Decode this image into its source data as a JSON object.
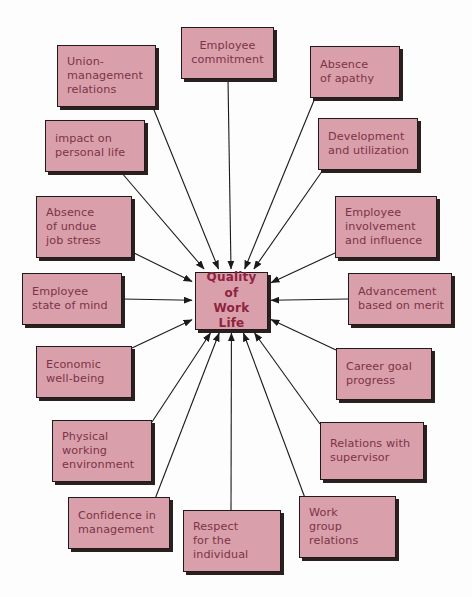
{
  "diagram": {
    "title": "Quality of Work Life",
    "center": {
      "id": "center",
      "label": "Quality of\nWork Life",
      "x": 195,
      "y": 272,
      "w": 73,
      "h": 58
    },
    "colors": {
      "node_fill": "#d9a0ab",
      "node_border": "#201a1a",
      "node_shadow": "#2a2020",
      "node_text": "#7d3347",
      "center_text": "#8e2340",
      "arrow": "#1a1a1a",
      "background": "#fdfdfd"
    },
    "nodes": [
      {
        "id": "union-management-relations",
        "label": "Union-\nmanagement\nrelations",
        "x": 57,
        "y": 45,
        "w": 99,
        "h": 62,
        "align": "left",
        "anchor_x": 152,
        "anchor_y": 105
      },
      {
        "id": "employee-commitment",
        "label": "Employee\ncommitment",
        "x": 181,
        "y": 27,
        "w": 93,
        "h": 52,
        "align": "center",
        "anchor_x": 228,
        "anchor_y": 79
      },
      {
        "id": "absence-of-apathy",
        "label": "Absence\nof apathy",
        "x": 310,
        "y": 46,
        "w": 90,
        "h": 52,
        "align": "left",
        "anchor_x": 315,
        "anchor_y": 98
      },
      {
        "id": "impact-on-personal-life",
        "label": "impact on\npersonal life",
        "x": 45,
        "y": 120,
        "w": 100,
        "h": 52,
        "align": "left",
        "anchor_x": 121,
        "anchor_y": 172
      },
      {
        "id": "development-and-utilization",
        "label": "Development\nand utilization",
        "x": 318,
        "y": 118,
        "w": 100,
        "h": 52,
        "align": "left",
        "anchor_x": 323,
        "anchor_y": 170
      },
      {
        "id": "absence-of-undue-job-stress",
        "label": "Absence\nof undue\njob stress",
        "x": 36,
        "y": 196,
        "w": 96,
        "h": 62,
        "align": "left",
        "anchor_x": 132,
        "anchor_y": 252
      },
      {
        "id": "employee-involvement-and-influence",
        "label": "Employee\ninvolvement\nand influence",
        "x": 335,
        "y": 196,
        "w": 102,
        "h": 62,
        "align": "left",
        "anchor_x": 335,
        "anchor_y": 253
      },
      {
        "id": "employee-state-of-mind",
        "label": "Employee\nstate of mind",
        "x": 22,
        "y": 273,
        "w": 100,
        "h": 52,
        "align": "left",
        "anchor_x": 122,
        "anchor_y": 299
      },
      {
        "id": "advancement-based-on-merit",
        "label": "Advancement\nbased on merit",
        "x": 348,
        "y": 273,
        "w": 104,
        "h": 52,
        "align": "left",
        "anchor_x": 348,
        "anchor_y": 299
      },
      {
        "id": "economic-well-being",
        "label": "Economic\nwell-being",
        "x": 36,
        "y": 346,
        "w": 96,
        "h": 52,
        "align": "left",
        "anchor_x": 132,
        "anchor_y": 348
      },
      {
        "id": "career-goal-progress",
        "label": "Career goal\nprogress",
        "x": 336,
        "y": 348,
        "w": 96,
        "h": 52,
        "align": "left",
        "anchor_x": 336,
        "anchor_y": 350
      },
      {
        "id": "physical-working-environment",
        "label": "Physical\nworking\nenvironment",
        "x": 52,
        "y": 420,
        "w": 100,
        "h": 62,
        "align": "left",
        "anchor_x": 152,
        "anchor_y": 422
      },
      {
        "id": "relations-with-supervisor",
        "label": "Relations with\nsupervisor",
        "x": 320,
        "y": 422,
        "w": 104,
        "h": 58,
        "align": "left",
        "anchor_x": 320,
        "anchor_y": 424
      },
      {
        "id": "confidence-in-management",
        "label": "Confidence in\nmanagement",
        "x": 68,
        "y": 497,
        "w": 102,
        "h": 52,
        "align": "left",
        "anchor_x": 155,
        "anchor_y": 499
      },
      {
        "id": "respect-for-the-individual",
        "label": "Respect\nfor the\nindividual",
        "x": 183,
        "y": 510,
        "w": 98,
        "h": 62,
        "align": "left",
        "anchor_x": 231,
        "anchor_y": 512
      },
      {
        "id": "work-group-relations",
        "label": "Work\ngroup\nrelations",
        "x": 299,
        "y": 496,
        "w": 97,
        "h": 62,
        "align": "left",
        "anchor_x": 305,
        "anchor_y": 498
      }
    ]
  }
}
